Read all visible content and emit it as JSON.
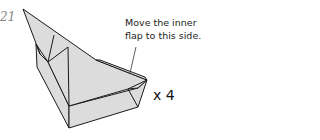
{
  "step_number": "21",
  "instruction_line1": "Move the inner",
  "instruction_line2": "flap to this side.",
  "repeat_label": "x 4",
  "colors": {
    "paper": "#dcdcdc",
    "line": "#1a1a1a"
  }
}
